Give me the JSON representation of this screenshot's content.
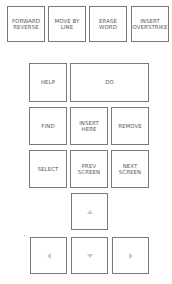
{
  "top_row": [
    {
      "label": "FORWARD\nREVERSE"
    },
    {
      "label": "MOVE BY\nLINE"
    },
    {
      "label": "ERASE\nWORD"
    },
    {
      "label": "INSERT\nOVERSTRIKE"
    }
  ],
  "editing_keypad": {
    "help": {
      "label": "HELP"
    },
    "do": {
      "label": "DO"
    },
    "find": {
      "label": "FIND"
    },
    "insert_here": {
      "label": "INSERT\nHERE"
    },
    "remove": {
      "label": "REMOVE"
    },
    "select": {
      "label": "SELECT"
    },
    "prev_screen": {
      "label": "PREV\nSCREEN"
    },
    "next_screen": {
      "label": "NEXT\nSCREEN"
    }
  },
  "arrow_keys": [
    {
      "direction": "up",
      "icon": "arrow-up-icon"
    },
    {
      "direction": "left",
      "icon": "arrow-left-icon"
    },
    {
      "direction": "down",
      "icon": "arrow-down-icon"
    },
    {
      "direction": "right",
      "icon": "arrow-right-icon"
    }
  ],
  "colors": {
    "key_border": "#7a7a7a",
    "key_text": "#5a5a5a",
    "arrow_glyph": "#b5b5b5",
    "background": "#ffffff"
  }
}
